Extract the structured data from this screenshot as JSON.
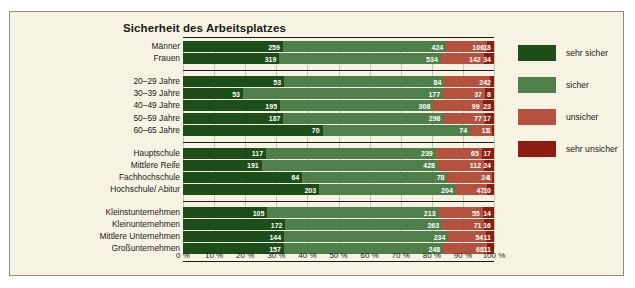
{
  "chart_data": {
    "type": "bar",
    "orientation": "horizontal",
    "stacked": true,
    "normalized_percent": true,
    "title": "Sicherheit des Arbeitsplatzes",
    "xlabel": "",
    "ylabel": "",
    "xlim": [
      0,
      100
    ],
    "grid": true,
    "legend_position": "right",
    "xticks": [
      "0 %",
      "10 %",
      "20 %",
      "30 %",
      "40 %",
      "50 %",
      "60 %",
      "70 %",
      "80 %",
      "90 %",
      "100 %"
    ],
    "series": [
      {
        "name": "sehr sicher",
        "color": "#1d4d18",
        "values": [
          259,
          319,
          53,
          53,
          195,
          187,
          70,
          117,
          191,
          64,
          203,
          105,
          172,
          144,
          157
        ]
      },
      {
        "name": "sicher",
        "color": "#4f7f4a",
        "values": [
          424,
          534,
          84,
          177,
          308,
          298,
          74,
          239,
          428,
          78,
          204,
          213,
          263,
          234,
          248
        ]
      },
      {
        "name": "unsicher",
        "color": "#b4513f",
        "values": [
          106,
          142,
          24,
          37,
          99,
          77,
          11,
          65,
          112,
          24,
          47,
          55,
          71,
          54,
          68
        ]
      },
      {
        "name": "sehr unsicher",
        "color": "#8e1d11",
        "values": [
          18,
          34,
          2,
          8,
          23,
          17,
          1,
          17,
          24,
          1,
          10,
          14,
          16,
          11,
          11
        ]
      }
    ],
    "groups": [
      {
        "categories": [
          "Männer",
          "Frauen"
        ]
      },
      {
        "categories": [
          "20–29 Jahre",
          "30–39 Jahre",
          "40–49 Jahre",
          "50–59 Jahre",
          "60–65 Jahre"
        ]
      },
      {
        "categories": [
          "Hauptschule",
          "Mittlere Reife",
          "Fachhochschule",
          "Hochschule/ Abitur"
        ]
      },
      {
        "categories": [
          "Kleinstunternehmen",
          "Kleinunternehmen",
          "Mittlere Unternehmen",
          "Großunternehmen"
        ]
      }
    ],
    "categories": [
      "Männer",
      "Frauen",
      "20–29 Jahre",
      "30–39 Jahre",
      "40–49 Jahre",
      "50–59 Jahre",
      "60–65 Jahre",
      "Hauptschule",
      "Mittlere Reife",
      "Fachhochschule",
      "Hochschule/ Abitur",
      "Kleinstunternehmen",
      "Kleinunternehmen",
      "Mittlere Unternehmen",
      "Großunternehmen"
    ]
  },
  "colors": {
    "background": "#f6f3e2",
    "frame_border": "#8e8d84",
    "grid": "#c9c7b4",
    "text": "#1b1b1b",
    "value_label": "#ffffff",
    "sehr_sicher": "#1d4d18",
    "sicher": "#4f7f4a",
    "unsicher": "#b4513f",
    "sehr_unsicher": "#8e1d11"
  }
}
